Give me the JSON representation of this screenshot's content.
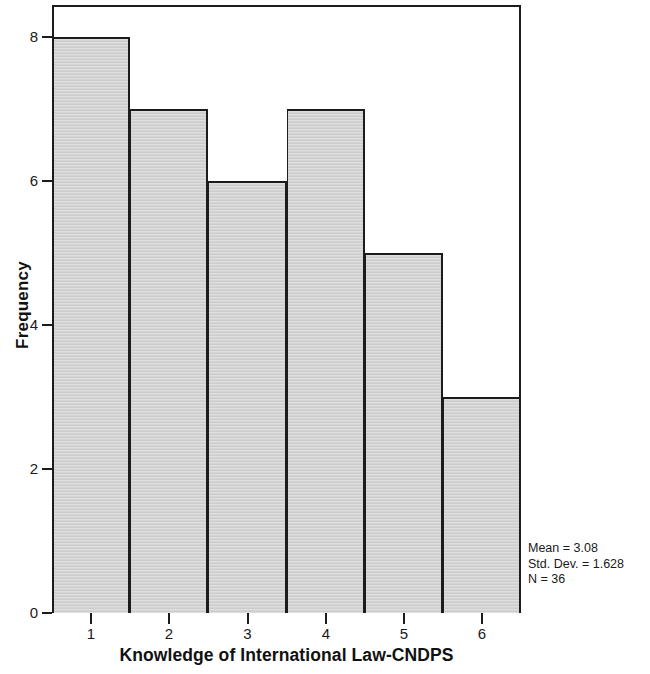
{
  "chart_data": {
    "type": "bar",
    "title": "",
    "subtitle": "",
    "xlabel": "Knowledge of International Law-CNDPS",
    "ylabel": "Frequency",
    "categories": [
      "1",
      "2",
      "3",
      "4",
      "5",
      "6"
    ],
    "values": [
      8,
      7,
      6,
      7,
      5,
      3
    ],
    "xtick_labels": [
      "1",
      "2",
      "3",
      "4",
      "5",
      "6"
    ],
    "ytick_labels": [
      "0",
      "2",
      "4",
      "6",
      "8"
    ],
    "ytick_values": [
      0,
      2,
      4,
      6,
      8
    ],
    "ylim": [
      0,
      8.45
    ],
    "xlim": [
      0.5,
      6.5
    ],
    "grid": false,
    "legend": null,
    "bar_fill_color": "#d4d4d4",
    "bar_edge_color": "#1c1c1c",
    "frame_color": "#1c1c1c",
    "background_color": "#ffffff",
    "annotations": {
      "mean_label": "Mean = 3.08",
      "std_dev_label": "Std. Dev. = 1.628",
      "n_label": "N = 36",
      "mean": 3.08,
      "std_dev": 1.628,
      "n": 36,
      "position": "bottom-right"
    }
  }
}
